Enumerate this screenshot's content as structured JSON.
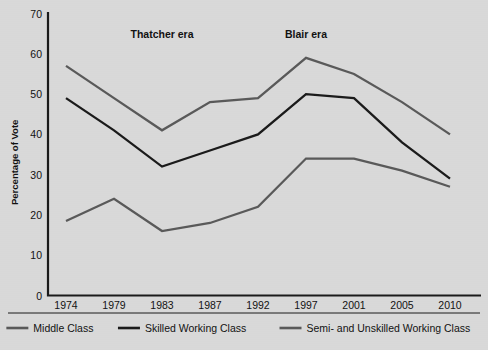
{
  "chart_data": {
    "type": "line",
    "title": "",
    "xlabel": "",
    "ylabel": "Percentage of Vote",
    "categories": [
      "1974",
      "1979",
      "1983",
      "1987",
      "1992",
      "1997",
      "2001",
      "2005",
      "2010"
    ],
    "ylim": [
      0,
      70
    ],
    "yticks": [
      0,
      10,
      20,
      30,
      40,
      50,
      60,
      70
    ],
    "ytick_labels": [
      "0",
      "10",
      "20",
      "30",
      "40",
      "50",
      "60",
      "70"
    ],
    "grid": false,
    "legend_position": "bottom",
    "series": [
      {
        "name": "Middle Class",
        "color": "#595959",
        "values": [
          57,
          49,
          41,
          48,
          49,
          59,
          55,
          48,
          40
        ]
      },
      {
        "name": "Skilled Working Class",
        "color": "#1a1a1a",
        "values": [
          49,
          41,
          32,
          36,
          40,
          50,
          49,
          38,
          29
        ]
      },
      {
        "name": "Semi- and Unskilled Working Class",
        "color": "#595959",
        "values": [
          18.5,
          24,
          16,
          18,
          22,
          34,
          34,
          31,
          27
        ]
      }
    ],
    "annotations": [
      {
        "text": "Thatcher era",
        "x_value": "1983",
        "y_value": 64
      },
      {
        "text": "Blair era",
        "x_value": "1997",
        "y_value": 64
      }
    ]
  },
  "legend": {
    "items": [
      {
        "label": "Middle Class",
        "color": "#595959"
      },
      {
        "label": "Skilled Working Class",
        "color": "#1a1a1a"
      },
      {
        "label": "Semi- and Unskilled Working Class",
        "color": "#595959"
      }
    ]
  },
  "axis": {
    "y_title": "Percentage of Vote"
  }
}
